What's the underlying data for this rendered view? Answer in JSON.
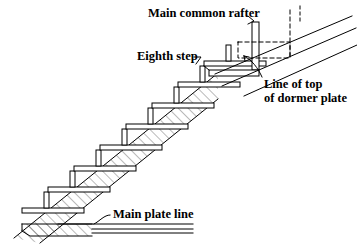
{
  "drawing": {
    "title": "Stair framing detail",
    "labels": {
      "main_common_rafter": "Main common rafter",
      "eighth_step": "Eighth step",
      "line_of_top_1": "Line of top",
      "line_of_top_2": "of dormer plate",
      "main_plate_line": "Main plate line"
    },
    "colors": {
      "ink": "#000000",
      "paper": "#ffffff",
      "hatch": "#444444"
    },
    "geometry": {
      "step_count": 8,
      "step_rise": 21,
      "step_run": 26,
      "first_tread_x": 22,
      "first_tread_y": 210,
      "tread_thickness": 5,
      "tread_overhang": 30,
      "riser_height": 16,
      "riser_width": 5,
      "stringer_depth": 26,
      "plate_top_y": 224,
      "plate_bottom_y": 233,
      "plate_right_x": 193,
      "dashed_box": {
        "x": 238,
        "y": 42,
        "w": 52,
        "h": 16
      },
      "rafter_lines": 3
    }
  }
}
